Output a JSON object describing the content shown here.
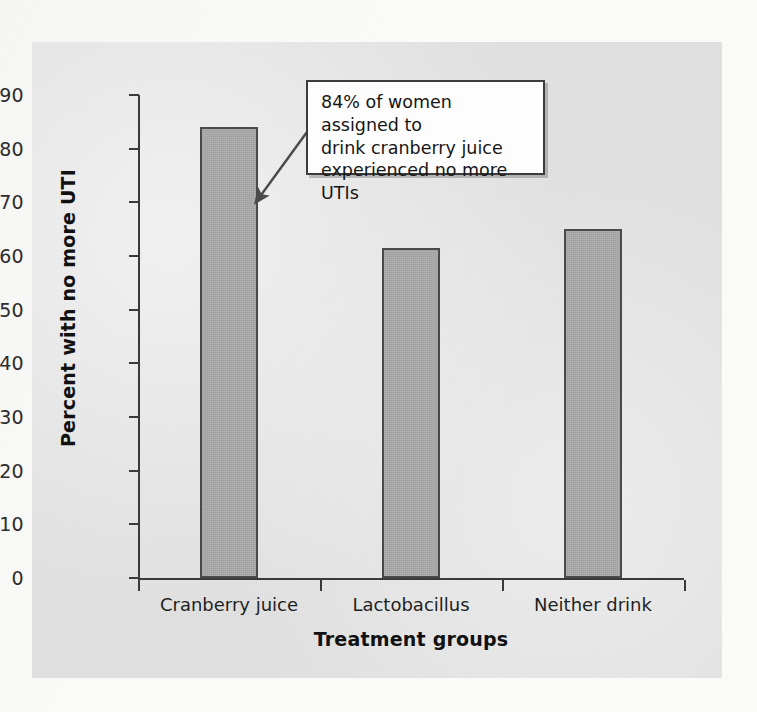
{
  "chart_data": {
    "type": "bar",
    "title": "",
    "subtitle": "",
    "categories": [
      "Cranberry juice",
      "Lactobacillus",
      "Neither drink"
    ],
    "values": [
      84,
      61.5,
      65
    ],
    "xlabel": "Treatment groups",
    "ylabel": "Percent with no more UTI",
    "ylim": [
      0,
      95
    ],
    "yticks": [
      0,
      10,
      20,
      30,
      40,
      50,
      60,
      70,
      80,
      90
    ],
    "ytick_labels": [
      "0",
      "10",
      "20",
      "30",
      "40",
      "50",
      "60",
      "70",
      "80",
      "90"
    ],
    "grid": false,
    "legend": false,
    "legend_position": "none",
    "annotations": [
      {
        "text": "84% of women assigned to drink cranberry juice experienced no more UTIs",
        "points_to_category": "Cranberry juice",
        "points_to_value": 70
      }
    ],
    "series": [
      {
        "name": "Percent with no more UTI",
        "values": [
          84,
          61.5,
          65
        ]
      }
    ]
  },
  "colors": {
    "bar_fill": "#a9a9a9",
    "bar_stroke": "#4a4a4a",
    "axis": "#3a3a3a",
    "panel_background": "#e2e2e2",
    "page_background": "#fafaf8",
    "annotation_background": "#fdfdfd",
    "annotation_border": "#3c3c3c",
    "text": "#1f1f1f"
  },
  "annotation": {
    "line1": "84% of women assigned to",
    "line2": "drink cranberry juice",
    "line3": "experienced no more UTIs"
  },
  "axes": {
    "y_title": "Percent with no more UTI",
    "x_title": "Treatment groups"
  }
}
